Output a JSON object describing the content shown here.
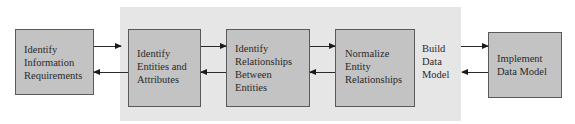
{
  "diagram": {
    "nodes": [
      {
        "id": "identify-info-req",
        "lines": [
          "Identify",
          "Information",
          "Requirements"
        ]
      },
      {
        "id": "identify-entities",
        "lines": [
          "Identify",
          "Entities and",
          "Attributes"
        ]
      },
      {
        "id": "identify-relationships",
        "lines": [
          "Identify",
          "Relationships",
          "Between",
          "Entities"
        ]
      },
      {
        "id": "normalize",
        "lines": [
          "Normalize",
          "Entity",
          "Relationships"
        ]
      },
      {
        "id": "implement",
        "lines": [
          "Implement",
          "Data Model"
        ]
      }
    ],
    "group_label": {
      "lines": [
        "Build",
        "Data",
        "Model"
      ]
    },
    "edges": [
      {
        "from": "identify-info-req",
        "to": "identify-entities",
        "bidirectional": true
      },
      {
        "from": "identify-entities",
        "to": "identify-relationships",
        "bidirectional": true
      },
      {
        "from": "identify-relationships",
        "to": "normalize",
        "bidirectional": true
      },
      {
        "from": "build-data-model",
        "to": "implement",
        "bidirectional": true
      }
    ],
    "colors": {
      "box_fill": "#c3c3c3",
      "panel_fill": "#e6e6e6",
      "border": "#5a5a5a"
    }
  }
}
